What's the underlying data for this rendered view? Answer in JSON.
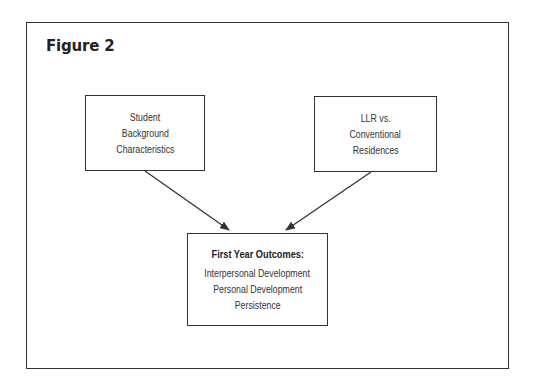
{
  "figure": {
    "title": "Figure 2"
  },
  "nodes": {
    "left": {
      "lines": [
        "Student",
        "Background",
        "Characteristics"
      ]
    },
    "right": {
      "lines": [
        "LLR vs.",
        "Conventional",
        "Residences"
      ]
    },
    "bottom": {
      "heading": "First Year Outcomes:",
      "lines": [
        "Interpersonal Development",
        "Personal Development",
        "Persistence"
      ]
    }
  },
  "edges": [
    {
      "from": "left",
      "to": "bottom"
    },
    {
      "from": "right",
      "to": "bottom"
    }
  ],
  "colors": {
    "stroke": "#333333",
    "background": "#ffffff"
  }
}
